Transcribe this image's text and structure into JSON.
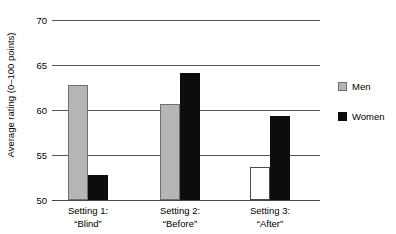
{
  "chart_data": {
    "type": "bar",
    "title": "",
    "xlabel": "",
    "ylabel": "Average rating (0–100 points)",
    "ylim": [
      50,
      70
    ],
    "yticks": [
      50,
      55,
      60,
      65,
      70
    ],
    "ytick_labels": [
      "50",
      "55",
      "60",
      "65",
      "70"
    ],
    "grid": true,
    "legend_position": "right",
    "categories": [
      {
        "line1": "Setting 1:",
        "line2": "“Blind”"
      },
      {
        "line1": "Setting 2:",
        "line2": "“Before”"
      },
      {
        "line1": "Setting 3:",
        "line2": "“After”"
      }
    ],
    "category_labels": [
      "Setting 1: “Blind”",
      "Setting 2: “Before”",
      "Setting 3: “After”"
    ],
    "series": [
      {
        "name": "Men",
        "color": "#b5b5b5",
        "values": [
          62.8,
          60.7,
          53.7
        ],
        "styles": [
          "filled",
          "filled",
          "open"
        ]
      },
      {
        "name": "Women",
        "color": "#0d0d0d",
        "values": [
          52.8,
          64.1,
          59.3
        ],
        "styles": [
          "filled",
          "filled",
          "filled"
        ]
      }
    ]
  },
  "legend": {
    "items": [
      {
        "label": "Men",
        "swatch": "men"
      },
      {
        "label": "Women",
        "swatch": "women"
      }
    ]
  },
  "colors": {
    "men": "#b5b5b5",
    "women": "#0d0d0d",
    "gridline": "#555555",
    "background": "#ffffff"
  }
}
